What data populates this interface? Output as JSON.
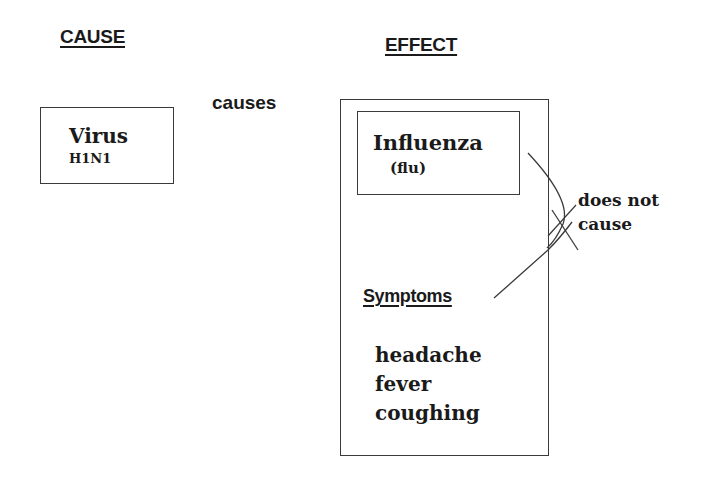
{
  "diagram": {
    "cause_heading": "CAUSE",
    "effect_heading": "EFFECT",
    "cause_box": {
      "title": "Virus",
      "subtitle": "H1N1"
    },
    "relation_label": "causes",
    "effect_box": {
      "inner_box": {
        "title": "Influenza",
        "subtitle": "(flu)"
      },
      "symptoms_heading": "Symptoms",
      "symptoms": [
        "headache",
        "fever",
        "coughing"
      ]
    },
    "negated_relation_label_line1": "does not",
    "negated_relation_label_line2": "cause",
    "colors": {
      "text": "#1a1a1a",
      "lines": "#3a3a3a",
      "background": "#ffffff"
    }
  }
}
